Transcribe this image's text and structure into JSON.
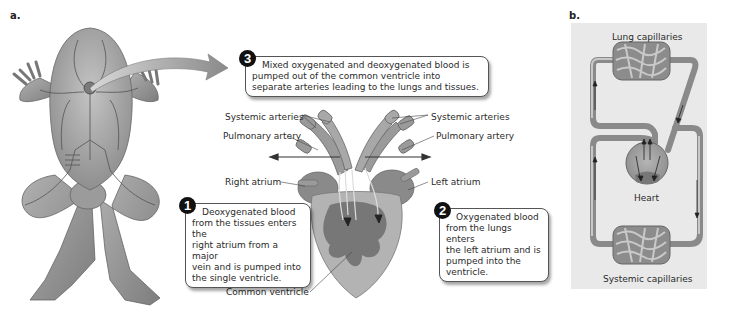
{
  "panel_a": {
    "letter": "a.",
    "callouts": [
      {
        "number": "1",
        "text": "Deoxygenated blood from the tissues enters the right atrium from a major vein and is pumped into the single ventricle.",
        "lines": [
          "Deoxygenated blood",
          "from the tissues enters the",
          "right atrium from a major",
          "vein and is pumped into",
          "the single ventricle."
        ]
      },
      {
        "number": "2",
        "text": "Oxygenated blood from the lungs enters the left atrium and is pumped into the ventricle.",
        "lines": [
          "Oxygenated blood",
          "from the lungs enters",
          "the left atrium and is",
          "pumped into the",
          "ventricle."
        ]
      },
      {
        "number": "3",
        "text": "Mixed oxygenated and deoxygenated blood is pumped out of the common ventricle into separate arteries leading to the lungs and tissues.",
        "lines": [
          "Mixed oxygenated and deoxygenated blood is",
          "pumped out of the common ventricle into",
          "separate arteries leading to the lungs and tissues."
        ]
      }
    ],
    "labels": {
      "systemic_arteries_left": "Systemic  arteries",
      "systemic_arteries_right": "Systemic arteries",
      "pulmonary_artery_left": "Pulmonary artery",
      "pulmonary_artery_right": "Pulmonary artery",
      "right_atrium": "Right atrium",
      "left_atrium": "Left atrium",
      "common_ventricle": "Common ventricle"
    }
  },
  "panel_b": {
    "letter": "b.",
    "labels": {
      "lung_capillaries": "Lung capillaries",
      "heart": "Heart",
      "systemic_capillaries": "Systemic capillaries"
    }
  },
  "colors": {
    "tissue": "#8a8a8a",
    "vessel": "#6e6e6e",
    "callout_number_bg": "#111111",
    "panel_b_bg": "#e9e9e9"
  }
}
